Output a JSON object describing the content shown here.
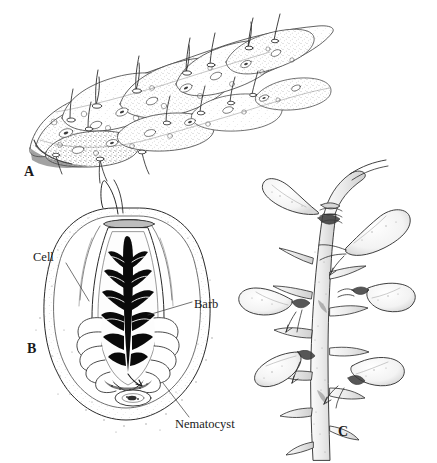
{
  "figure": {
    "background_color": "#ffffff",
    "ink_color": "#1a1a1a",
    "width": 437,
    "height": 463
  },
  "panels": [
    {
      "letter": "A",
      "name": "epithelium-with-cnidocils",
      "description": "Surface view of epidermal tissue with stippled elongate cells bearing protruding cnidocil spines"
    },
    {
      "letter": "B",
      "name": "cnidocyte-cross-section",
      "description": "Cross-section of a cnidocyte showing capsule, coiled thread and barbed shaft"
    },
    {
      "letter": "C",
      "name": "discharged-nematocyst-branch",
      "description": "Branched tentacle with spines and teardrop-shaped nematocyst batteries"
    }
  ],
  "labels": {
    "cell": "Cell",
    "barb": "Barb",
    "nematocyst": "Nematocyst"
  }
}
